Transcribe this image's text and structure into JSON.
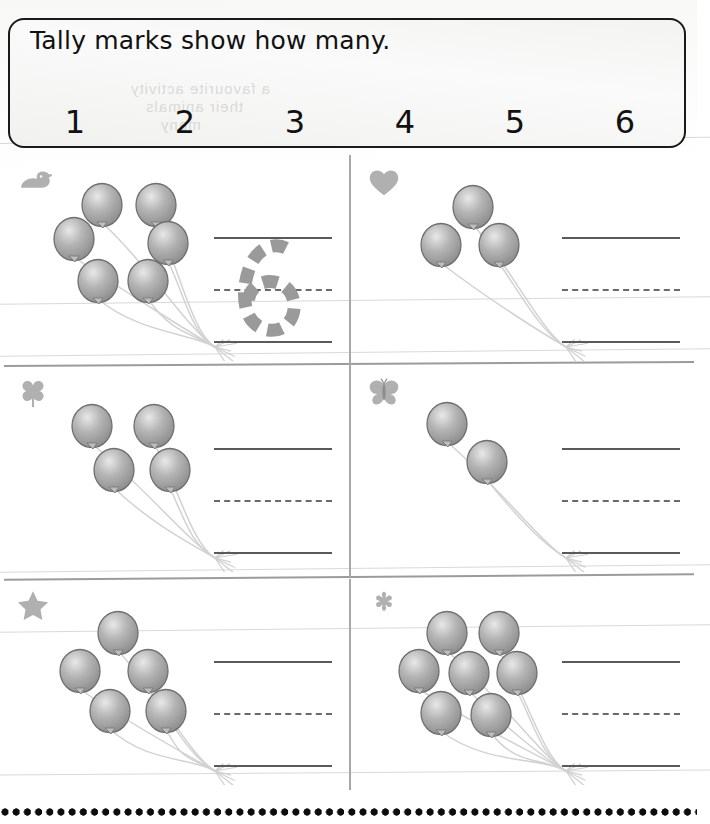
{
  "worksheet": {
    "title": "Tally marks show how many.",
    "subject": "tally-marks-counting-balloons",
    "ghost_text": {
      "line1": "a favourite activity",
      "line2": "their animals",
      "line3": "many"
    }
  },
  "key": {
    "entries": [
      {
        "number": "1",
        "tally_value": 1
      },
      {
        "number": "2",
        "tally_value": 2
      },
      {
        "number": "3",
        "tally_value": 3
      },
      {
        "number": "4",
        "tally_value": 4
      },
      {
        "number": "5",
        "tally_value": 5
      },
      {
        "number": "6",
        "tally_value": 6
      }
    ]
  },
  "problems": [
    {
      "id": "problem-1",
      "badge_icon": "duck-icon",
      "balloon_count": 6,
      "tally_value": 6,
      "answer_value": "6",
      "answer_state": "traced"
    },
    {
      "id": "problem-2",
      "badge_icon": "heart-icon",
      "balloon_count": 3,
      "tally_value": 3,
      "answer_value": "",
      "answer_state": "blank"
    },
    {
      "id": "problem-3",
      "badge_icon": "clover-icon",
      "balloon_count": 4,
      "tally_value": 4,
      "answer_value": "",
      "answer_state": "blank"
    },
    {
      "id": "problem-4",
      "badge_icon": "butterfly-icon",
      "balloon_count": 2,
      "tally_value": 2,
      "answer_value": "",
      "answer_state": "blank"
    },
    {
      "id": "problem-5",
      "badge_icon": "star-icon",
      "balloon_count": 5,
      "tally_value": 5,
      "answer_value": "",
      "answer_state": "blank"
    },
    {
      "id": "problem-6",
      "badge_icon": "flower-icon",
      "balloon_count": 7,
      "tally_value": 7,
      "answer_value": "",
      "answer_state": "blank"
    }
  ],
  "colors": {
    "ink": "#0d0d0d",
    "balloon_gray": "#9a9a9a",
    "badge_gray": "#b0b0b0",
    "rule_line": "#5a5a5a",
    "divider": "#9b9b9b",
    "traced_digit": "#9a9a9a"
  },
  "balloon_layouts": {
    "2": [
      [
        52,
        36
      ],
      [
        92,
        74
      ]
    ],
    "3": [
      [
        78,
        30
      ],
      [
        46,
        68
      ],
      [
        104,
        68
      ]
    ],
    "4": [
      [
        48,
        38
      ],
      [
        110,
        38
      ],
      [
        70,
        82
      ],
      [
        126,
        82
      ]
    ],
    "5": [
      [
        74,
        32
      ],
      [
        36,
        70
      ],
      [
        104,
        70
      ],
      [
        66,
        110
      ],
      [
        122,
        110
      ]
    ],
    "6": [
      [
        58,
        28
      ],
      [
        112,
        28
      ],
      [
        30,
        62
      ],
      [
        124,
        66
      ],
      [
        54,
        104
      ],
      [
        104,
        104
      ]
    ],
    "7": [
      [
        52,
        32
      ],
      [
        104,
        32
      ],
      [
        24,
        70
      ],
      [
        74,
        72
      ],
      [
        122,
        72
      ],
      [
        46,
        112
      ],
      [
        96,
        114
      ]
    ]
  }
}
